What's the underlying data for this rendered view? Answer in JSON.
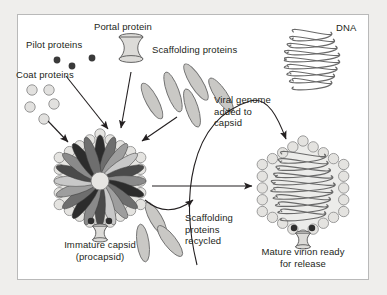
{
  "figure": {
    "background_color": "#efeeec",
    "panel_color": "#ffffff",
    "border_color": "#b9b9b9",
    "ink_color": "#231f20"
  },
  "labels": {
    "pilot_proteins": "Pilot proteins",
    "portal_protein": "Portal protein",
    "coat_proteins": "Coat proteins",
    "scaffolding_proteins": "Scaffolding proteins",
    "dna": "DNA",
    "viral_genome_added": "Viral genome\nadded to\ncapsid",
    "immature_capsid": "Immature capsid\n(procapsid)",
    "scaffolding_recycled": "Scaffolding\nproteins\nrecycled",
    "mature_virion": "Mature virion ready\nfor release"
  },
  "components": {
    "pilot_proteins": {
      "name": "pilot-proteins",
      "count": 3,
      "fill": "#3a3a3a",
      "radius": 3.4,
      "points": [
        [
          57,
          60
        ],
        [
          72,
          66
        ],
        [
          92,
          58
        ]
      ]
    },
    "coat_proteins": {
      "name": "coat-proteins",
      "count": 5,
      "fill": "#e2e1df",
      "stroke": "#8c8c8c",
      "radius": 5.2,
      "points": [
        [
          32,
          90
        ],
        [
          49,
          90
        ],
        [
          30,
          107
        ],
        [
          54,
          104
        ],
        [
          44,
          119
        ]
      ]
    },
    "scaffolding_proteins_free": {
      "name": "scaffolding-proteins",
      "count": 5,
      "fill": "#c9c8c5",
      "stroke": "#6f6f6f",
      "ellipses": [
        [
          152,
          101,
          6,
          20,
          -28
        ],
        [
          173,
          92,
          6,
          21,
          -20
        ],
        [
          196,
          82,
          6,
          21,
          -32
        ],
        [
          192,
          108,
          6,
          20,
          -18
        ],
        [
          221,
          95,
          6,
          20,
          -34
        ]
      ]
    },
    "scaffolding_proteins_recycled": {
      "name": "scaffolding-proteins-recycled",
      "count": 3,
      "fill": "#c9c8c5",
      "stroke": "#6f6f6f",
      "ellipses": [
        [
          156,
          219,
          6,
          19,
          -30
        ],
        [
          143,
          243,
          6,
          19,
          -8
        ],
        [
          170,
          241,
          6,
          19,
          -38
        ]
      ]
    },
    "immature_capsid": {
      "name": "immature-capsid",
      "center": [
        100,
        181
      ],
      "shell_radius": 47,
      "shell_bead_count": 22,
      "shell_bead_radius": 5.2,
      "petal_count": 20,
      "petal_shades": [
        "#2c2c2c",
        "#6e6e6e",
        "#9e9e9e",
        "#c8c8c8",
        "#4a4a4a",
        "#8a8a8a"
      ],
      "core_fill": "#e6e5e2"
    },
    "mature_virion": {
      "name": "mature-virion",
      "center": [
        303,
        188
      ],
      "shell_radius": 47,
      "shell_bead_count": 22,
      "shell_bead_radius": 5.2,
      "interior_fill": "#ececea",
      "dna_stroke": "#6a6a6a"
    },
    "portal_icon": {
      "name": "portal-protein-icon",
      "position": [
        131,
        48
      ],
      "fill": "#dcdbd8",
      "stroke": "#555555"
    },
    "dna_coil": {
      "name": "dna-coil",
      "center": [
        312,
        58
      ],
      "stroke": "#6a6a6a"
    }
  },
  "arrows": {
    "pilot_to_capsid": {
      "name": "arrow-pilot-to-capsid"
    },
    "portal_to_capsid": {
      "name": "arrow-portal-to-capsid"
    },
    "coat_to_capsid": {
      "name": "arrow-coat-to-capsid"
    },
    "scaffolding_to_capsid": {
      "name": "arrow-scaffolding-to-capsid"
    },
    "genome_curve": {
      "name": "arrow-viral-genome-to-capsid"
    },
    "maturation": {
      "name": "arrow-procapsid-to-virion"
    },
    "recycle_curve": {
      "name": "arrow-scaffolding-recycled"
    }
  }
}
